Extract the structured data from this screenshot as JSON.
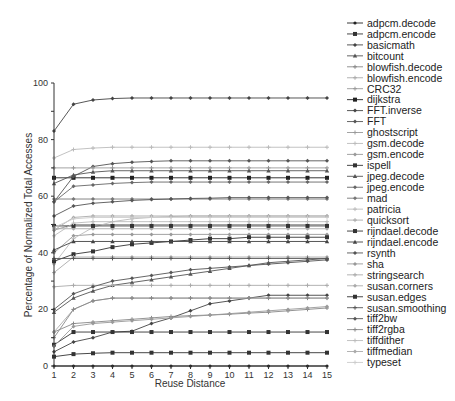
{
  "chart_data": {
    "type": "line",
    "title": "",
    "xlabel": "Reuse Distance",
    "ylabel": "Percentage of Normalized Total Accesses",
    "x": [
      1,
      2,
      3,
      4,
      5,
      6,
      7,
      8,
      9,
      10,
      11,
      12,
      13,
      14,
      15
    ],
    "xlim": [
      1,
      15
    ],
    "ylim": [
      0,
      100
    ],
    "yticks": [
      0,
      20,
      40,
      60,
      80,
      100
    ],
    "xticks": [
      1,
      2,
      3,
      4,
      5,
      6,
      7,
      8,
      9,
      10,
      11,
      12,
      13,
      14,
      15
    ],
    "grid": false,
    "legend_position": "right",
    "series": [
      {
        "name": "adpcm.decode",
        "color": "#222222",
        "marker": "circle",
        "values": [
          0,
          0,
          0,
          0,
          0,
          0,
          0,
          0,
          0,
          0,
          0,
          0,
          0,
          0,
          0
        ]
      },
      {
        "name": "adpcm.encode",
        "color": "#333333",
        "marker": "square",
        "values": [
          3.3,
          4.2,
          4.5,
          4.7,
          4.7,
          4.7,
          4.7,
          4.7,
          4.7,
          4.7,
          4.7,
          4.7,
          4.7,
          4.7,
          4.7
        ]
      },
      {
        "name": "basicmath",
        "color": "#444444",
        "marker": "diamond",
        "values": [
          5,
          8.5,
          10,
          12,
          12.3,
          15,
          17,
          19.5,
          22,
          23,
          24,
          25,
          25,
          25,
          25
        ]
      },
      {
        "name": "bitcount",
        "color": "#555555",
        "marker": "triangle",
        "values": [
          19,
          24,
          26.5,
          28.5,
          29.5,
          30.5,
          31.5,
          32.5,
          33.5,
          34.5,
          35.5,
          36.5,
          37,
          37.5,
          38
        ]
      },
      {
        "name": "blowfish.decode",
        "color": "#888888",
        "marker": "plus",
        "values": [
          12,
          15,
          15.5,
          16,
          16.5,
          17,
          17.5,
          17.8,
          18,
          18.3,
          18.7,
          19,
          19.5,
          20,
          20.5
        ]
      },
      {
        "name": "blowfish.encode",
        "color": "#aaaaaa",
        "marker": "plus",
        "values": [
          28,
          28.5,
          28.5,
          28.5,
          28.5,
          28.5,
          28.5,
          28.5,
          28.5,
          28.5,
          28.5,
          28.5,
          28.5,
          28.5,
          28.5
        ]
      },
      {
        "name": "CRC32",
        "color": "#999999",
        "marker": "plus",
        "values": [
          48,
          50,
          50,
          50,
          50,
          50,
          50,
          50,
          50,
          50,
          50,
          50,
          50,
          50,
          50
        ]
      },
      {
        "name": "dijkstra",
        "color": "#222222",
        "marker": "square",
        "values": [
          66.5,
          66.5,
          66.5,
          66.5,
          66.5,
          66.5,
          66.5,
          66.5,
          66.5,
          66.5,
          66.5,
          66.5,
          66.5,
          66.5,
          66.5
        ]
      },
      {
        "name": "FFT.inverse",
        "color": "#444444",
        "marker": "diamond",
        "values": [
          83,
          92.5,
          94,
          94.5,
          94.7,
          94.7,
          94.7,
          94.7,
          94.7,
          94.7,
          94.7,
          94.7,
          94.7,
          94.7,
          94.7
        ]
      },
      {
        "name": "FFT",
        "color": "#555555",
        "marker": "diamond",
        "values": [
          58,
          67,
          70.5,
          71.5,
          72,
          72.3,
          72.5,
          72.5,
          72.5,
          72.5,
          72.5,
          72.5,
          72.5,
          72.5,
          72.5
        ]
      },
      {
        "name": "ghostscript",
        "color": "#999999",
        "marker": "plus",
        "values": [
          70,
          70,
          70,
          70,
          70,
          70,
          70,
          70,
          70,
          70,
          70,
          70,
          70,
          70,
          70
        ]
      },
      {
        "name": "gsm.decode",
        "color": "#bbbbbb",
        "marker": "plus",
        "values": [
          73.5,
          76.5,
          77,
          77.3,
          77.3,
          77.3,
          77.3,
          77.3,
          77.3,
          77.3,
          77.3,
          77.3,
          77.3,
          77.3,
          77.3
        ]
      },
      {
        "name": "gsm.encode",
        "color": "#999999",
        "marker": "diamond",
        "values": [
          40,
          46,
          46.5,
          46.5,
          46.5,
          46.5,
          46.5,
          46.5,
          46.5,
          46.5,
          46.5,
          46.5,
          46.5,
          46.5,
          46.5
        ]
      },
      {
        "name": "ispell",
        "color": "#333333",
        "marker": "square",
        "values": [
          7.5,
          12,
          12,
          12,
          12,
          12,
          12,
          12,
          12,
          12,
          12,
          12,
          12,
          12,
          12
        ]
      },
      {
        "name": "jpeg.decode",
        "color": "#555555",
        "marker": "triangle",
        "values": [
          64.5,
          67.5,
          68.5,
          69,
          69,
          69,
          69,
          69,
          69,
          69,
          69,
          69,
          69,
          69,
          69
        ]
      },
      {
        "name": "jpeg.encode",
        "color": "#666666",
        "marker": "diamond",
        "values": [
          58,
          63.5,
          64,
          64.5,
          64.8,
          65,
          65,
          65,
          65,
          65,
          65,
          65,
          65,
          65,
          65
        ]
      },
      {
        "name": "mad",
        "color": "#777777",
        "marker": "diamond",
        "values": [
          59,
          59,
          59,
          59,
          59,
          59,
          59,
          59,
          59,
          59,
          59,
          59,
          59,
          59,
          59
        ]
      },
      {
        "name": "patricia",
        "color": "#bbbbbb",
        "marker": "plus",
        "values": [
          36,
          45,
          49,
          51,
          52,
          52.5,
          52.8,
          53,
          53,
          53,
          53,
          53,
          53,
          53,
          53
        ]
      },
      {
        "name": "quicksort",
        "color": "#aaaaaa",
        "marker": "plus",
        "values": [
          12,
          20,
          23,
          24,
          24,
          24,
          24,
          24,
          24,
          24,
          24,
          24,
          24,
          24,
          24
        ]
      },
      {
        "name": "rijndael.decode",
        "color": "#333333",
        "marker": "square",
        "values": [
          37,
          39.5,
          40.5,
          42,
          43,
          43.5,
          44,
          44.5,
          45,
          45,
          45.5,
          45.5,
          45.5,
          45.5,
          45.5
        ]
      },
      {
        "name": "rijndael.encode",
        "color": "#444444",
        "marker": "triangle",
        "values": [
          41,
          44,
          44,
          44,
          44,
          44,
          44,
          44,
          44,
          44,
          44,
          44,
          44,
          44,
          44
        ]
      },
      {
        "name": "rsynth",
        "color": "#555555",
        "marker": "diamond",
        "values": [
          20,
          25.5,
          28,
          30,
          31,
          32,
          33,
          34,
          34.5,
          35,
          35.5,
          36,
          36.5,
          37,
          37.5
        ]
      },
      {
        "name": "sha",
        "color": "#999999",
        "marker": "diamond",
        "values": [
          7,
          14,
          15,
          15.5,
          16,
          16.5,
          17,
          17.5,
          18,
          18.5,
          19,
          19.5,
          20,
          20.5,
          21
        ]
      },
      {
        "name": "stringsearch",
        "color": "#aaaaaa",
        "marker": "plus",
        "values": [
          33,
          38.5,
          38.5,
          38.5,
          38.5,
          38.5,
          38.5,
          38.5,
          38.5,
          38.5,
          38.5,
          38.5,
          38.5,
          38.5,
          38.5
        ]
      },
      {
        "name": "susan.corners",
        "color": "#aaaaaa",
        "marker": "diamond",
        "values": [
          48.5,
          48.5,
          48.5,
          48.5,
          48.5,
          48.5,
          48.5,
          48.5,
          48.5,
          48.5,
          48.5,
          48.5,
          48.5,
          48.5,
          48.5
        ]
      },
      {
        "name": "susan.edges",
        "color": "#333333",
        "marker": "square",
        "values": [
          49.5,
          49.5,
          49.5,
          49.5,
          49.5,
          49.5,
          49.5,
          49.5,
          49.5,
          49.5,
          49.5,
          49.5,
          49.5,
          49.5,
          49.5
        ]
      },
      {
        "name": "susan.smoothing",
        "color": "#555555",
        "marker": "plus",
        "values": [
          38,
          38,
          38,
          38,
          38,
          38,
          38,
          38,
          38,
          38,
          38,
          38,
          38,
          38,
          38
        ]
      },
      {
        "name": "tiff2bw",
        "color": "#555555",
        "marker": "diamond",
        "values": [
          53,
          56.5,
          57.5,
          58,
          58.5,
          58.8,
          59,
          59.2,
          59.3,
          59.5,
          59.5,
          59.5,
          59.5,
          59.5,
          59.5
        ]
      },
      {
        "name": "tiff2rgba",
        "color": "#888888",
        "marker": "plus",
        "values": [
          10,
          20,
          23,
          24,
          24,
          24,
          24,
          24,
          24,
          24,
          24,
          24,
          24,
          24,
          24
        ]
      },
      {
        "name": "tiffdither",
        "color": "#bbbbbb",
        "marker": "plus",
        "values": [
          46,
          50.5,
          51,
          51,
          51,
          51,
          51,
          51,
          51,
          51,
          51,
          51,
          51,
          51,
          51
        ]
      },
      {
        "name": "tiffmedian",
        "color": "#aaaaaa",
        "marker": "diamond",
        "values": [
          48,
          52.5,
          53,
          53,
          53,
          53,
          53,
          53,
          53,
          53,
          53,
          53,
          53,
          53,
          53
        ]
      },
      {
        "name": "typeset",
        "color": "#cccccc",
        "marker": "plus",
        "values": [
          49,
          52,
          52.5,
          52.5,
          52.5,
          52.5,
          52.5,
          52.5,
          52.5,
          52.5,
          52.5,
          52.5,
          52.5,
          52.5,
          52.5
        ]
      }
    ]
  }
}
